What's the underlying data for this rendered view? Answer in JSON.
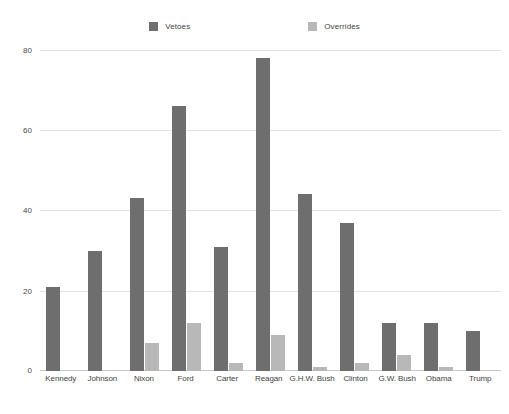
{
  "chart_data": {
    "type": "bar",
    "title": "",
    "xlabel": "",
    "ylabel": "",
    "ylim": [
      0,
      80
    ],
    "yticks": [
      0,
      20,
      40,
      60,
      80
    ],
    "ytick_labels": [
      "0",
      "20",
      "40",
      "60",
      "80"
    ],
    "grid": true,
    "legend_position": "top-center",
    "categories": [
      "Kennedy",
      "Johnson",
      "Nixon",
      "Ford",
      "Carter",
      "Reagan",
      "G.H.W. Bush",
      "Clinton",
      "G.W. Bush",
      "Obama",
      "Trump"
    ],
    "series": [
      {
        "name": "Vetoes",
        "color": "#6e6e6e",
        "values": [
          21,
          30,
          43,
          66,
          31,
          78,
          44,
          37,
          12,
          12,
          10
        ]
      },
      {
        "name": "Overrides",
        "color": "#b8b8b8",
        "values": [
          0,
          0,
          7,
          12,
          2,
          9,
          1,
          2,
          4,
          1,
          0
        ]
      }
    ]
  },
  "legend": {
    "items": [
      {
        "label": "Vetoes",
        "color": "#6e6e6e",
        "swatch_icon": "square-swatch-icon"
      },
      {
        "label": "Overrides",
        "color": "#b8b8b8",
        "swatch_icon": "square-swatch-icon"
      }
    ]
  },
  "colors": {
    "background": "#ffffff",
    "gridline": "#e2e2e2",
    "axis": "#c9c9c9",
    "text": "#3f3f3f",
    "vetoes": "#6e6e6e",
    "overrides": "#b8b8b8"
  }
}
